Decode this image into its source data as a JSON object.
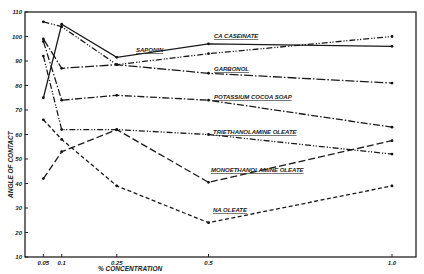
{
  "chart_data": {
    "type": "line",
    "title": "",
    "xlabel": "% CONCENTRATION",
    "ylabel": "ANGLE OF CONTACT",
    "x": [
      0.05,
      0.1,
      0.25,
      0.5,
      1.0
    ],
    "x_tick_labels": [
      "0.05",
      "0.1",
      "0.25",
      "0.5",
      "1.0"
    ],
    "ylim": [
      10,
      110
    ],
    "y_ticks": [
      10,
      20,
      30,
      40,
      50,
      60,
      70,
      80,
      90,
      100,
      110
    ],
    "grid": false,
    "legend": "inline labels",
    "series": [
      {
        "name": "CA CASEINATE",
        "style": "solid",
        "values": [
          75,
          105,
          91.5,
          97,
          96
        ]
      },
      {
        "name": "SAPONIN",
        "style": "dash-dot-dot",
        "values": [
          106,
          104,
          88.5,
          93,
          100
        ]
      },
      {
        "name": "GARBONOL",
        "style": "long-dash-dot",
        "values": [
          99,
          87,
          88.5,
          85,
          81
        ]
      },
      {
        "name": "POTASSIUM COCOA SOAP",
        "style": "dash-dot",
        "values": [
          98,
          74,
          76,
          74,
          63
        ]
      },
      {
        "name": "TRIETHANOLAMINE OLEATE",
        "style": "dash-dot-dot",
        "values": [
          92,
          62,
          62,
          60,
          52
        ]
      },
      {
        "name": "MONOETHANOLAMINE OLEATE",
        "style": "long-dash",
        "values": [
          42,
          53,
          62,
          40.5,
          57.5
        ]
      },
      {
        "name": "NA OLEATE",
        "style": "dashed",
        "values": [
          66,
          58,
          39,
          24,
          39
        ]
      }
    ]
  }
}
